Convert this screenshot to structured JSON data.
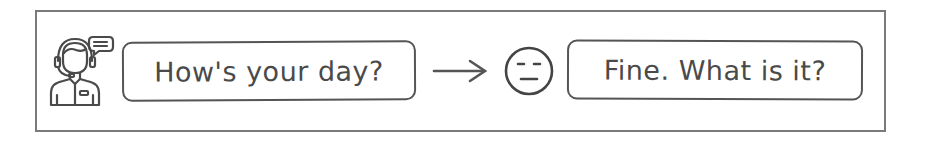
{
  "diagram": {
    "agent_icon": "customer-support-agent-with-headset-and-chat-bubble-icon",
    "question": "How's your day?",
    "connector": "arrow-right",
    "reaction_icon": "neutral-face-icon",
    "answer": "Fine. What is it?"
  },
  "colors": {
    "stroke": "#555555",
    "frame": "#7a7a7a",
    "text": "#4a4a4a",
    "background": "#ffffff"
  }
}
